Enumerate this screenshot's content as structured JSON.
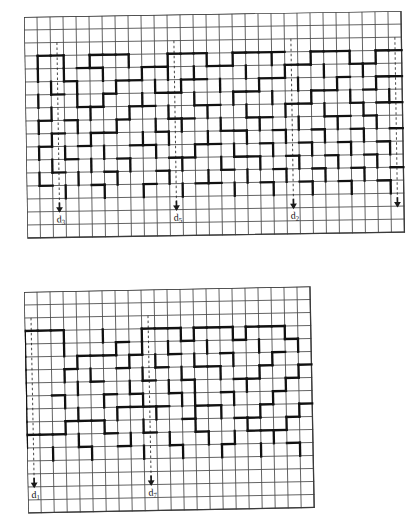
{
  "document": {
    "type": "scanned-figure",
    "description": "Two rectangular grid mazes with bold wall segments and labeled entrance arrows",
    "background_color": "#ffffff",
    "ink_color": "#1a1a1a",
    "grid_line_color": "#3a3a3a",
    "wall_color": "#111111"
  },
  "panels": [
    {
      "id": "top-maze",
      "name": "Top maze grid",
      "x": 24,
      "y": 17,
      "cols": 29,
      "rows": 17,
      "cell": 13.0,
      "skew_deg": -0.9,
      "entrances": [
        {
          "label_text": "d",
          "label_sub": "3",
          "col": 2
        },
        {
          "label_text": "d",
          "label_sub": "5",
          "col": 11
        },
        {
          "label_text": "d",
          "label_sub": "2",
          "col": 20
        },
        {
          "label_text": "",
          "label_sub": "",
          "col": 28
        }
      ],
      "walls_h": [
        [
          1,
          3
        ],
        [
          2,
          3
        ],
        [
          5,
          3
        ],
        [
          6,
          3
        ],
        [
          7,
          3
        ],
        [
          11,
          3
        ],
        [
          12,
          3
        ],
        [
          13,
          3
        ],
        [
          16,
          3
        ],
        [
          17,
          3
        ],
        [
          18,
          3
        ],
        [
          19,
          3
        ],
        [
          22,
          3
        ],
        [
          23,
          3
        ],
        [
          24,
          3
        ],
        [
          27,
          3
        ],
        [
          28,
          3
        ],
        [
          4,
          4
        ],
        [
          5,
          4
        ],
        [
          9,
          4
        ],
        [
          10,
          4
        ],
        [
          14,
          4
        ],
        [
          15,
          4
        ],
        [
          20,
          4
        ],
        [
          21,
          4
        ],
        [
          25,
          4
        ],
        [
          26,
          4
        ],
        [
          3,
          5
        ],
        [
          7,
          5
        ],
        [
          8,
          5
        ],
        [
          12,
          5
        ],
        [
          13,
          5
        ],
        [
          18,
          5
        ],
        [
          19,
          5
        ],
        [
          24,
          5
        ],
        [
          27,
          5
        ],
        [
          28,
          5
        ],
        [
          2,
          6
        ],
        [
          6,
          6
        ],
        [
          10,
          6
        ],
        [
          11,
          6
        ],
        [
          16,
          6
        ],
        [
          17,
          6
        ],
        [
          22,
          6
        ],
        [
          23,
          6
        ],
        [
          26,
          6
        ],
        [
          4,
          7
        ],
        [
          5,
          7
        ],
        [
          8,
          7
        ],
        [
          9,
          7
        ],
        [
          13,
          7
        ],
        [
          14,
          7
        ],
        [
          20,
          7
        ],
        [
          21,
          7
        ],
        [
          25,
          7
        ],
        [
          27,
          7
        ],
        [
          28,
          7
        ],
        [
          1,
          8
        ],
        [
          3,
          8
        ],
        [
          7,
          8
        ],
        [
          11,
          8
        ],
        [
          12,
          8
        ],
        [
          17,
          8
        ],
        [
          18,
          8
        ],
        [
          23,
          8
        ],
        [
          24,
          8
        ],
        [
          26,
          8
        ],
        [
          2,
          9
        ],
        [
          5,
          9
        ],
        [
          6,
          9
        ],
        [
          10,
          9
        ],
        [
          15,
          9
        ],
        [
          16,
          9
        ],
        [
          19,
          9
        ],
        [
          22,
          9
        ],
        [
          25,
          9
        ],
        [
          28,
          9
        ],
        [
          1,
          10
        ],
        [
          4,
          10
        ],
        [
          8,
          10
        ],
        [
          9,
          10
        ],
        [
          13,
          10
        ],
        [
          14,
          10
        ],
        [
          18,
          10
        ],
        [
          21,
          10
        ],
        [
          24,
          10
        ],
        [
          27,
          10
        ],
        [
          3,
          11
        ],
        [
          7,
          11
        ],
        [
          11,
          11
        ],
        [
          12,
          11
        ],
        [
          16,
          11
        ],
        [
          17,
          11
        ],
        [
          20,
          11
        ],
        [
          23,
          11
        ],
        [
          26,
          11
        ],
        [
          2,
          12
        ],
        [
          6,
          12
        ],
        [
          10,
          12
        ],
        [
          15,
          12
        ],
        [
          19,
          12
        ],
        [
          22,
          12
        ],
        [
          25,
          12
        ],
        [
          28,
          12
        ],
        [
          1,
          13
        ],
        [
          5,
          13
        ],
        [
          9,
          13
        ],
        [
          13,
          13
        ],
        [
          14,
          13
        ],
        [
          18,
          13
        ],
        [
          21,
          13
        ],
        [
          24,
          13
        ],
        [
          27,
          13
        ]
      ],
      "walls_v": [
        [
          1,
          3
        ],
        [
          3,
          3
        ],
        [
          5,
          3
        ],
        [
          8,
          3
        ],
        [
          11,
          3
        ],
        [
          14,
          3
        ],
        [
          16,
          3
        ],
        [
          19,
          3
        ],
        [
          22,
          3
        ],
        [
          25,
          3
        ],
        [
          27,
          3
        ],
        [
          1,
          4
        ],
        [
          3,
          4
        ],
        [
          6,
          4
        ],
        [
          9,
          4
        ],
        [
          11,
          4
        ],
        [
          13,
          4
        ],
        [
          17,
          4
        ],
        [
          20,
          4
        ],
        [
          23,
          4
        ],
        [
          26,
          4
        ],
        [
          2,
          5
        ],
        [
          4,
          5
        ],
        [
          7,
          5
        ],
        [
          10,
          5
        ],
        [
          12,
          5
        ],
        [
          15,
          5
        ],
        [
          18,
          5
        ],
        [
          21,
          5
        ],
        [
          24,
          5
        ],
        [
          27,
          5
        ],
        [
          1,
          6
        ],
        [
          4,
          6
        ],
        [
          6,
          6
        ],
        [
          9,
          6
        ],
        [
          13,
          6
        ],
        [
          16,
          6
        ],
        [
          19,
          6
        ],
        [
          22,
          6
        ],
        [
          25,
          6
        ],
        [
          28,
          6
        ],
        [
          2,
          7
        ],
        [
          5,
          7
        ],
        [
          8,
          7
        ],
        [
          11,
          7
        ],
        [
          14,
          7
        ],
        [
          17,
          7
        ],
        [
          20,
          7
        ],
        [
          23,
          7
        ],
        [
          26,
          7
        ],
        [
          1,
          8
        ],
        [
          4,
          8
        ],
        [
          7,
          8
        ],
        [
          10,
          8
        ],
        [
          12,
          8
        ],
        [
          15,
          8
        ],
        [
          18,
          8
        ],
        [
          21,
          8
        ],
        [
          24,
          8
        ],
        [
          27,
          8
        ],
        [
          2,
          9
        ],
        [
          5,
          9
        ],
        [
          9,
          9
        ],
        [
          11,
          9
        ],
        [
          14,
          9
        ],
        [
          17,
          9
        ],
        [
          20,
          9
        ],
        [
          23,
          9
        ],
        [
          26,
          9
        ],
        [
          1,
          10
        ],
        [
          3,
          10
        ],
        [
          6,
          10
        ],
        [
          10,
          10
        ],
        [
          13,
          10
        ],
        [
          16,
          10
        ],
        [
          19,
          10
        ],
        [
          22,
          10
        ],
        [
          25,
          10
        ],
        [
          28,
          10
        ],
        [
          2,
          11
        ],
        [
          5,
          11
        ],
        [
          8,
          11
        ],
        [
          12,
          11
        ],
        [
          15,
          11
        ],
        [
          18,
          11
        ],
        [
          21,
          11
        ],
        [
          24,
          11
        ],
        [
          27,
          11
        ],
        [
          1,
          12
        ],
        [
          4,
          12
        ],
        [
          7,
          12
        ],
        [
          11,
          12
        ],
        [
          14,
          12
        ],
        [
          17,
          12
        ],
        [
          20,
          12
        ],
        [
          23,
          12
        ],
        [
          26,
          12
        ],
        [
          3,
          13
        ],
        [
          6,
          13
        ],
        [
          9,
          13
        ],
        [
          12,
          13
        ],
        [
          16,
          13
        ],
        [
          19,
          13
        ],
        [
          22,
          13
        ],
        [
          25,
          13
        ],
        [
          28,
          13
        ]
      ]
    },
    {
      "id": "bottom-maze",
      "name": "Bottom maze grid",
      "x": 24,
      "y": 292,
      "cols": 22,
      "rows": 17,
      "cell": 13.0,
      "skew_deg": -1.1,
      "entrances": [
        {
          "label_text": "d",
          "label_sub": "1",
          "col": 0
        },
        {
          "label_text": "d",
          "label_sub": "7",
          "col": 9
        }
      ],
      "walls_h": [
        [
          0,
          3
        ],
        [
          1,
          3
        ],
        [
          2,
          3
        ],
        [
          9,
          3
        ],
        [
          10,
          3
        ],
        [
          11,
          3
        ],
        [
          13,
          3
        ],
        [
          14,
          3
        ],
        [
          15,
          3
        ],
        [
          17,
          3
        ],
        [
          18,
          3
        ],
        [
          19,
          3
        ],
        [
          7,
          4
        ],
        [
          12,
          4
        ],
        [
          16,
          4
        ],
        [
          20,
          4
        ],
        [
          4,
          5
        ],
        [
          5,
          5
        ],
        [
          6,
          5
        ],
        [
          8,
          5
        ],
        [
          11,
          5
        ],
        [
          15,
          5
        ],
        [
          19,
          5
        ],
        [
          3,
          6
        ],
        [
          7,
          6
        ],
        [
          10,
          6
        ],
        [
          13,
          6
        ],
        [
          14,
          6
        ],
        [
          18,
          6
        ],
        [
          21,
          6
        ],
        [
          5,
          7
        ],
        [
          9,
          7
        ],
        [
          12,
          7
        ],
        [
          16,
          7
        ],
        [
          17,
          7
        ],
        [
          20,
          7
        ],
        [
          2,
          8
        ],
        [
          6,
          8
        ],
        [
          8,
          8
        ],
        [
          11,
          8
        ],
        [
          15,
          8
        ],
        [
          19,
          8
        ],
        [
          7,
          9
        ],
        [
          8,
          9
        ],
        [
          9,
          9
        ],
        [
          10,
          9
        ],
        [
          13,
          9
        ],
        [
          14,
          9
        ],
        [
          18,
          9
        ],
        [
          21,
          9
        ],
        [
          3,
          10
        ],
        [
          4,
          10
        ],
        [
          5,
          10
        ],
        [
          12,
          10
        ],
        [
          16,
          10
        ],
        [
          17,
          10
        ],
        [
          20,
          10
        ],
        [
          0,
          11
        ],
        [
          1,
          11
        ],
        [
          2,
          11
        ],
        [
          6,
          11
        ],
        [
          9,
          11
        ],
        [
          13,
          11
        ],
        [
          17,
          11
        ],
        [
          18,
          11
        ],
        [
          19,
          11
        ],
        [
          4,
          12
        ],
        [
          7,
          12
        ],
        [
          11,
          12
        ],
        [
          15,
          12
        ],
        [
          20,
          12
        ]
      ],
      "walls_v": [
        [
          0,
          3
        ],
        [
          3,
          3
        ],
        [
          6,
          3
        ],
        [
          9,
          3
        ],
        [
          12,
          3
        ],
        [
          13,
          3
        ],
        [
          16,
          3
        ],
        [
          17,
          3
        ],
        [
          20,
          3
        ],
        [
          0,
          4
        ],
        [
          3,
          4
        ],
        [
          7,
          4
        ],
        [
          9,
          4
        ],
        [
          11,
          4
        ],
        [
          14,
          4
        ],
        [
          18,
          4
        ],
        [
          21,
          4
        ],
        [
          0,
          5
        ],
        [
          4,
          5
        ],
        [
          8,
          5
        ],
        [
          10,
          5
        ],
        [
          13,
          5
        ],
        [
          16,
          5
        ],
        [
          19,
          5
        ],
        [
          0,
          6
        ],
        [
          3,
          6
        ],
        [
          5,
          6
        ],
        [
          9,
          6
        ],
        [
          12,
          6
        ],
        [
          15,
          6
        ],
        [
          18,
          6
        ],
        [
          21,
          6
        ],
        [
          0,
          7
        ],
        [
          4,
          7
        ],
        [
          8,
          7
        ],
        [
          11,
          7
        ],
        [
          13,
          7
        ],
        [
          17,
          7
        ],
        [
          20,
          7
        ],
        [
          0,
          8
        ],
        [
          3,
          8
        ],
        [
          6,
          8
        ],
        [
          9,
          8
        ],
        [
          12,
          8
        ],
        [
          13,
          8
        ],
        [
          16,
          8
        ],
        [
          19,
          8
        ],
        [
          0,
          9
        ],
        [
          4,
          9
        ],
        [
          7,
          9
        ],
        [
          10,
          9
        ],
        [
          13,
          9
        ],
        [
          15,
          9
        ],
        [
          18,
          9
        ],
        [
          21,
          9
        ],
        [
          0,
          10
        ],
        [
          3,
          10
        ],
        [
          6,
          10
        ],
        [
          9,
          10
        ],
        [
          13,
          10
        ],
        [
          17,
          10
        ],
        [
          20,
          10
        ],
        [
          0,
          11
        ],
        [
          4,
          11
        ],
        [
          8,
          11
        ],
        [
          11,
          11
        ],
        [
          14,
          11
        ],
        [
          16,
          11
        ],
        [
          19,
          11
        ],
        [
          2,
          12
        ],
        [
          5,
          12
        ],
        [
          9,
          12
        ],
        [
          12,
          12
        ],
        [
          15,
          12
        ],
        [
          18,
          12
        ],
        [
          21,
          12
        ]
      ]
    }
  ]
}
